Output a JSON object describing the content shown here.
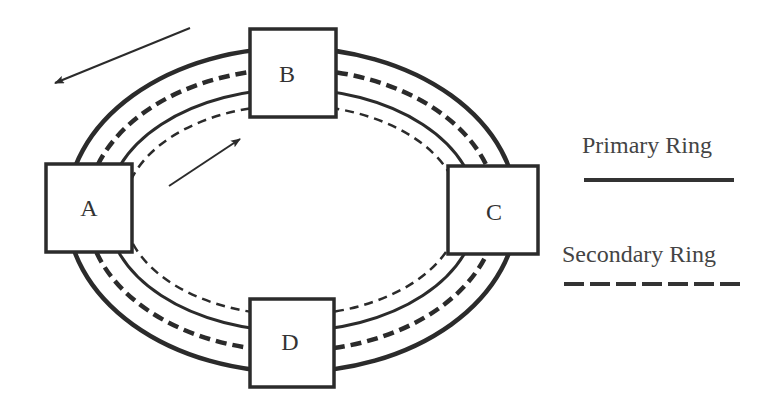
{
  "diagram": {
    "center": {
      "x": 292,
      "y": 209
    },
    "rings": [
      {
        "name": "outer-primary-ring",
        "type": "primary",
        "rx": 225,
        "ry": 162,
        "stroke_width": 4.5
      },
      {
        "name": "outer-secondary-ring",
        "type": "secondary",
        "rx": 205,
        "ry": 141,
        "stroke_width": 4.5
      },
      {
        "name": "inner-primary-ring",
        "type": "primary",
        "rx": 185,
        "ry": 121,
        "stroke_width": 3
      },
      {
        "name": "inner-secondary-ring",
        "type": "secondary",
        "rx": 168,
        "ry": 105,
        "stroke_width": 2.5
      }
    ],
    "nodes": [
      {
        "id": "A",
        "label": "A",
        "x": 45,
        "y": 163,
        "w": 88,
        "h": 90
      },
      {
        "id": "B",
        "label": "B",
        "x": 249,
        "y": 28,
        "w": 88,
        "h": 90
      },
      {
        "id": "C",
        "label": "C",
        "x": 447,
        "y": 165,
        "w": 92,
        "h": 90
      },
      {
        "id": "D",
        "label": "D",
        "x": 249,
        "y": 298,
        "w": 86,
        "h": 90
      }
    ],
    "arrows": [
      {
        "name": "counterclockwise-arrow-outer",
        "direction": "counterclockwise",
        "x1": 190,
        "y1": 28,
        "x2": 54,
        "y2": 83
      },
      {
        "name": "clockwise-arrow-inner",
        "direction": "clockwise",
        "x1": 169,
        "y1": 186,
        "x2": 241,
        "y2": 138
      }
    ]
  },
  "legend": {
    "items": [
      {
        "label": "Primary Ring",
        "style": "solid"
      },
      {
        "label": "Secondary Ring",
        "style": "dashed"
      }
    ]
  },
  "colors": {
    "stroke": "#2b2b2b",
    "text": "#333333",
    "background": "#ffffff"
  }
}
